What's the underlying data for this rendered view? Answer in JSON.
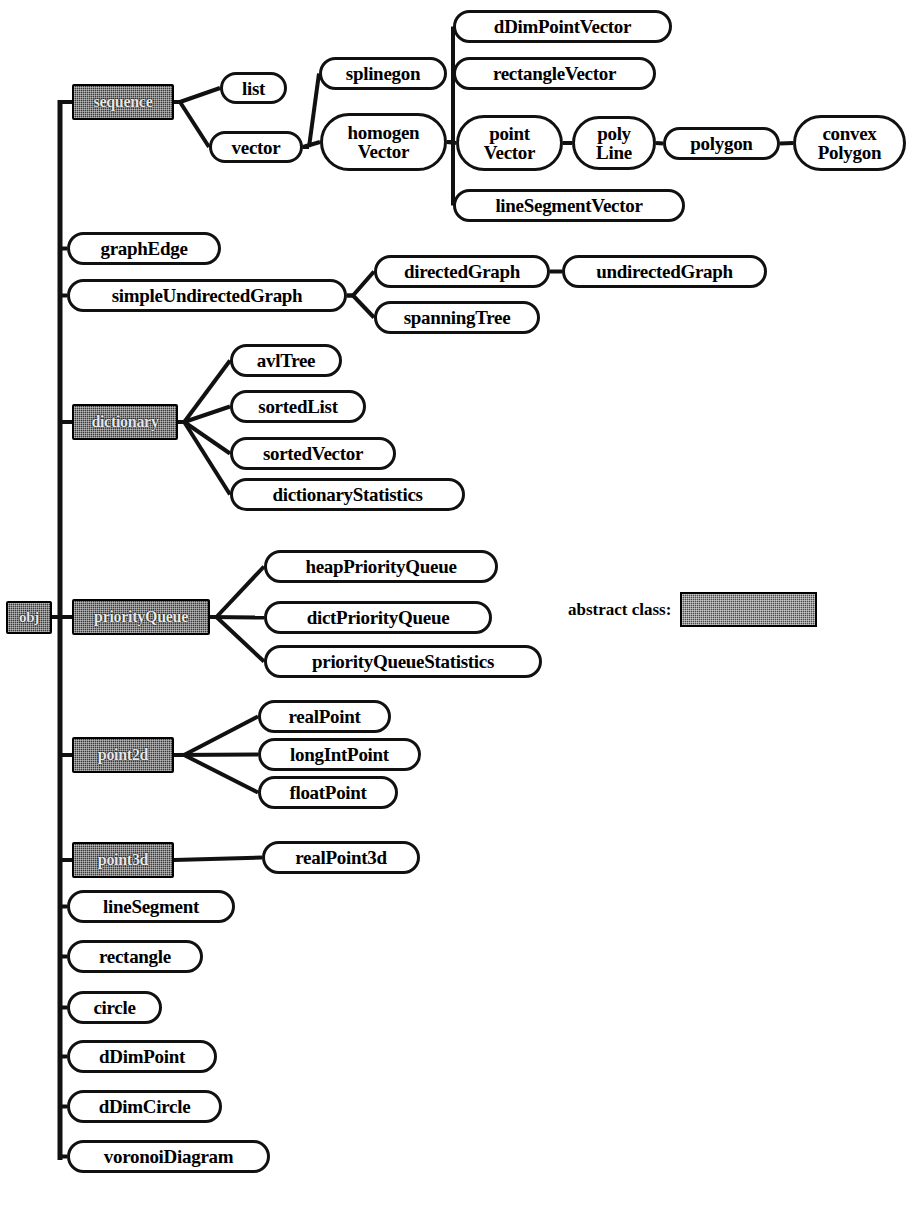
{
  "figure": {
    "caption": "",
    "root_label": "obj",
    "colors": {
      "stroke": "#111111",
      "node_fill": "#ffffff",
      "abstract_fill": "#3a3a3a",
      "abstract_text": "#e8e8e8",
      "background": "#ffffff"
    }
  },
  "legend": {
    "label": "abstract class:",
    "swatch_name": "abstract-class-swatch"
  },
  "nodes": [
    {
      "id": "obj",
      "label": "obj",
      "kind": "abstract",
      "x": 6,
      "y": 601,
      "w": 46,
      "h": 33,
      "fs": 15
    },
    {
      "id": "sequence",
      "label": "sequence",
      "kind": "abstract",
      "x": 72,
      "y": 84,
      "w": 102,
      "h": 36,
      "fs": 16
    },
    {
      "id": "list",
      "label": "list",
      "kind": "concrete",
      "x": 220,
      "y": 72,
      "w": 67,
      "h": 32,
      "fs": 19
    },
    {
      "id": "vector",
      "label": "vector",
      "kind": "concrete",
      "x": 209,
      "y": 131,
      "w": 94,
      "h": 32,
      "fs": 19
    },
    {
      "id": "splinegon",
      "label": "splinegon",
      "kind": "concrete",
      "x": 319,
      "y": 57,
      "w": 128,
      "h": 33,
      "fs": 19
    },
    {
      "id": "homogenVector",
      "label": "homogen\nVector",
      "kind": "concrete",
      "x": 320,
      "y": 113,
      "w": 127,
      "h": 58,
      "fs": 19
    },
    {
      "id": "dDimPointVector",
      "label": "dDimPointVector",
      "kind": "concrete",
      "x": 453,
      "y": 10,
      "w": 219,
      "h": 33,
      "fs": 19
    },
    {
      "id": "rectangleVector",
      "label": "rectangleVector",
      "kind": "concrete",
      "x": 453,
      "y": 57,
      "w": 203,
      "h": 33,
      "fs": 19
    },
    {
      "id": "pointVector",
      "label": "point\nVector",
      "kind": "concrete",
      "x": 456,
      "y": 115,
      "w": 107,
      "h": 56,
      "fs": 19
    },
    {
      "id": "polyLine",
      "label": "poly\nLine",
      "kind": "concrete",
      "x": 572,
      "y": 116,
      "w": 84,
      "h": 54,
      "fs": 19
    },
    {
      "id": "polygon",
      "label": "polygon",
      "kind": "concrete",
      "x": 663,
      "y": 127,
      "w": 117,
      "h": 33,
      "fs": 19
    },
    {
      "id": "convexPolygon",
      "label": "convex\nPolygon",
      "kind": "concrete",
      "x": 793,
      "y": 115,
      "w": 113,
      "h": 56,
      "fs": 19
    },
    {
      "id": "lineSegmentVector",
      "label": "lineSegmentVector",
      "kind": "concrete",
      "x": 453,
      "y": 189,
      "w": 232,
      "h": 33,
      "fs": 19
    },
    {
      "id": "graphEdge",
      "label": "graphEdge",
      "kind": "concrete",
      "x": 67,
      "y": 232,
      "w": 154,
      "h": 33,
      "fs": 19
    },
    {
      "id": "simpleUndirectedGraph",
      "label": "simpleUndirectedGraph",
      "kind": "concrete",
      "x": 67,
      "y": 279,
      "w": 280,
      "h": 33,
      "fs": 19
    },
    {
      "id": "directedGraph",
      "label": "directedGraph",
      "kind": "concrete",
      "x": 374,
      "y": 255,
      "w": 176,
      "h": 33,
      "fs": 19
    },
    {
      "id": "undirectedGraph",
      "label": "undirectedGraph",
      "kind": "concrete",
      "x": 562,
      "y": 255,
      "w": 205,
      "h": 33,
      "fs": 19
    },
    {
      "id": "spanningTree",
      "label": "spanningTree",
      "kind": "concrete",
      "x": 374,
      "y": 301,
      "w": 166,
      "h": 33,
      "fs": 19
    },
    {
      "id": "dictionary",
      "label": "dictionary",
      "kind": "abstract",
      "x": 72,
      "y": 404,
      "w": 106,
      "h": 36,
      "fs": 16
    },
    {
      "id": "avlTree",
      "label": "avlTree",
      "kind": "concrete",
      "x": 230,
      "y": 344,
      "w": 112,
      "h": 33,
      "fs": 19
    },
    {
      "id": "sortedList",
      "label": "sortedList",
      "kind": "concrete",
      "x": 230,
      "y": 390,
      "w": 136,
      "h": 33,
      "fs": 19
    },
    {
      "id": "sortedVector",
      "label": "sortedVector",
      "kind": "concrete",
      "x": 230,
      "y": 437,
      "w": 166,
      "h": 33,
      "fs": 19
    },
    {
      "id": "dictionaryStatistics",
      "label": "dictionaryStatistics",
      "kind": "concrete",
      "x": 230,
      "y": 478,
      "w": 235,
      "h": 33,
      "fs": 19
    },
    {
      "id": "priorityQueue",
      "label": "priorityQueue",
      "kind": "abstract",
      "x": 72,
      "y": 599,
      "w": 138,
      "h": 36,
      "fs": 16
    },
    {
      "id": "heapPriorityQueue",
      "label": "heapPriorityQueue",
      "kind": "concrete",
      "x": 264,
      "y": 550,
      "w": 234,
      "h": 33,
      "fs": 19
    },
    {
      "id": "dictPriorityQueue",
      "label": "dictPriorityQueue",
      "kind": "concrete",
      "x": 264,
      "y": 601,
      "w": 228,
      "h": 33,
      "fs": 19
    },
    {
      "id": "priorityQueueStatistics",
      "label": "priorityQueueStatistics",
      "kind": "concrete",
      "x": 264,
      "y": 645,
      "w": 278,
      "h": 33,
      "fs": 19
    },
    {
      "id": "point2d",
      "label": "point2d",
      "kind": "abstract",
      "x": 72,
      "y": 737,
      "w": 102,
      "h": 36,
      "fs": 16
    },
    {
      "id": "realPoint",
      "label": "realPoint",
      "kind": "concrete",
      "x": 258,
      "y": 700,
      "w": 133,
      "h": 33,
      "fs": 19
    },
    {
      "id": "longIntPoint",
      "label": "longIntPoint",
      "kind": "concrete",
      "x": 258,
      "y": 738,
      "w": 163,
      "h": 33,
      "fs": 19
    },
    {
      "id": "floatPoint",
      "label": "floatPoint",
      "kind": "concrete",
      "x": 258,
      "y": 776,
      "w": 140,
      "h": 33,
      "fs": 19
    },
    {
      "id": "point3d",
      "label": "point3d",
      "kind": "abstract",
      "x": 72,
      "y": 842,
      "w": 102,
      "h": 36,
      "fs": 16
    },
    {
      "id": "realPoint3d",
      "label": "realPoint3d",
      "kind": "concrete",
      "x": 262,
      "y": 841,
      "w": 158,
      "h": 33,
      "fs": 19
    },
    {
      "id": "lineSegment",
      "label": "lineSegment",
      "kind": "concrete",
      "x": 67,
      "y": 890,
      "w": 168,
      "h": 33,
      "fs": 19
    },
    {
      "id": "rectangle",
      "label": "rectangle",
      "kind": "concrete",
      "x": 67,
      "y": 940,
      "w": 136,
      "h": 33,
      "fs": 19
    },
    {
      "id": "circle",
      "label": "circle",
      "kind": "concrete",
      "x": 67,
      "y": 991,
      "w": 95,
      "h": 33,
      "fs": 19
    },
    {
      "id": "dDimPoint",
      "label": "dDimPoint",
      "kind": "concrete",
      "x": 67,
      "y": 1040,
      "w": 150,
      "h": 33,
      "fs": 19
    },
    {
      "id": "dDimCircle",
      "label": "dDimCircle",
      "kind": "concrete",
      "x": 67,
      "y": 1090,
      "w": 155,
      "h": 33,
      "fs": 19
    },
    {
      "id": "voronoiDiagram",
      "label": "voronoiDiagram",
      "kind": "concrete",
      "x": 67,
      "y": 1140,
      "w": 203,
      "h": 33,
      "fs": 19
    }
  ],
  "edges": [
    {
      "from": "obj",
      "to": "spine",
      "kind": "stub"
    },
    {
      "from": "spine",
      "to": "sequence",
      "kind": "spine-branch"
    },
    {
      "from": "spine",
      "to": "graphEdge",
      "kind": "spine-branch"
    },
    {
      "from": "spine",
      "to": "simpleUndirectedGraph",
      "kind": "spine-branch"
    },
    {
      "from": "spine",
      "to": "dictionary",
      "kind": "spine-branch"
    },
    {
      "from": "spine",
      "to": "priorityQueue",
      "kind": "spine-branch"
    },
    {
      "from": "spine",
      "to": "point2d",
      "kind": "spine-branch"
    },
    {
      "from": "spine",
      "to": "point3d",
      "kind": "spine-branch"
    },
    {
      "from": "spine",
      "to": "lineSegment",
      "kind": "spine-branch"
    },
    {
      "from": "spine",
      "to": "rectangle",
      "kind": "spine-branch"
    },
    {
      "from": "spine",
      "to": "circle",
      "kind": "spine-branch"
    },
    {
      "from": "spine",
      "to": "dDimPoint",
      "kind": "spine-branch"
    },
    {
      "from": "spine",
      "to": "dDimCircle",
      "kind": "spine-branch"
    },
    {
      "from": "spine",
      "to": "voronoiDiagram",
      "kind": "spine-branch"
    },
    {
      "from": "sequence",
      "to": "list",
      "kind": "fan"
    },
    {
      "from": "sequence",
      "to": "vector",
      "kind": "fan"
    },
    {
      "from": "vector",
      "to": "splinegon",
      "kind": "fan"
    },
    {
      "from": "vector",
      "to": "homogenVector",
      "kind": "straight"
    },
    {
      "from": "homogenVector",
      "to": "dDimPointVector",
      "kind": "fan"
    },
    {
      "from": "homogenVector",
      "to": "rectangleVector",
      "kind": "fan"
    },
    {
      "from": "homogenVector",
      "to": "pointVector",
      "kind": "straight"
    },
    {
      "from": "homogenVector",
      "to": "lineSegmentVector",
      "kind": "fan"
    },
    {
      "from": "pointVector",
      "to": "polyLine",
      "kind": "straight"
    },
    {
      "from": "polyLine",
      "to": "polygon",
      "kind": "straight"
    },
    {
      "from": "polygon",
      "to": "convexPolygon",
      "kind": "straight"
    },
    {
      "from": "simpleUndirectedGraph",
      "to": "directedGraph",
      "kind": "fan"
    },
    {
      "from": "simpleUndirectedGraph",
      "to": "spanningTree",
      "kind": "fan"
    },
    {
      "from": "directedGraph",
      "to": "undirectedGraph",
      "kind": "straight"
    },
    {
      "from": "dictionary",
      "to": "avlTree",
      "kind": "fan"
    },
    {
      "from": "dictionary",
      "to": "sortedList",
      "kind": "fan"
    },
    {
      "from": "dictionary",
      "to": "sortedVector",
      "kind": "fan"
    },
    {
      "from": "dictionary",
      "to": "dictionaryStatistics",
      "kind": "fan"
    },
    {
      "from": "priorityQueue",
      "to": "heapPriorityQueue",
      "kind": "fan"
    },
    {
      "from": "priorityQueue",
      "to": "dictPriorityQueue",
      "kind": "straight"
    },
    {
      "from": "priorityQueue",
      "to": "priorityQueueStatistics",
      "kind": "fan"
    },
    {
      "from": "point2d",
      "to": "realPoint",
      "kind": "fan"
    },
    {
      "from": "point2d",
      "to": "longIntPoint",
      "kind": "straight"
    },
    {
      "from": "point2d",
      "to": "floatPoint",
      "kind": "fan"
    },
    {
      "from": "point3d",
      "to": "realPoint3d",
      "kind": "straight"
    }
  ],
  "geometry": {
    "spine_x": 60,
    "spine_top": 100,
    "spine_bottom": 1160,
    "root_connector_y": 617,
    "stroke_width": 4
  }
}
